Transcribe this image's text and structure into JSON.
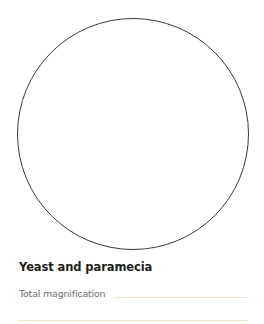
{
  "figure": {
    "shape": "microscope-field-of-view-circle"
  },
  "section": {
    "title": "Yeast and paramecia",
    "fields": [
      {
        "label": "Total magnification",
        "value": ""
      }
    ]
  },
  "colors": {
    "circle_stroke": "#3a3a3a",
    "answer_line": "#f3e2cf",
    "title": "#1e1e1e",
    "label": "#707070"
  }
}
